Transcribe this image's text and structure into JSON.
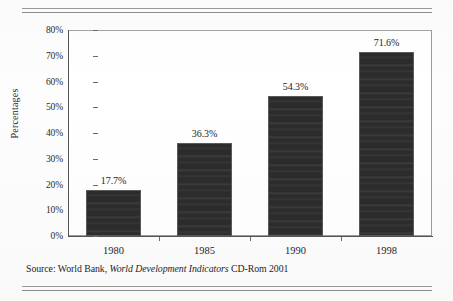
{
  "figure": {
    "background_color": "#fdfdfd",
    "rule_color": "#8c8c8c",
    "bar_color": "#2c2c2c"
  },
  "chart_data": {
    "type": "bar",
    "title": "",
    "subtitle": "",
    "xlabel": "",
    "ylabel": "Percentages",
    "categories": [
      "1980",
      "1985",
      "1990",
      "1998"
    ],
    "values": [
      17.7,
      36.3,
      54.3,
      71.6
    ],
    "data_labels": [
      "17.7%",
      "36.3%",
      "54.3%",
      "71.6%"
    ],
    "ylim": [
      0,
      80
    ],
    "ytick_values": [
      0,
      10,
      20,
      30,
      40,
      50,
      60,
      70,
      80
    ],
    "ytick_labels": [
      "0%",
      "10%",
      "20%",
      "30%",
      "40%",
      "50%",
      "60%",
      "70%",
      "80%"
    ],
    "grid": false,
    "legend": null,
    "legend_position": "none",
    "bar_color": "#2c2c2c",
    "series": [
      {
        "name": "Percentages",
        "values": [
          17.7,
          36.3,
          54.3,
          71.6
        ]
      }
    ]
  },
  "source": {
    "prefix": "Source: World Bank, ",
    "italic_title": "World Development Indicators",
    "suffix": " CD-Rom 2001",
    "full_text": "Source: World Bank, World Development Indicators CD-Rom 2001"
  }
}
